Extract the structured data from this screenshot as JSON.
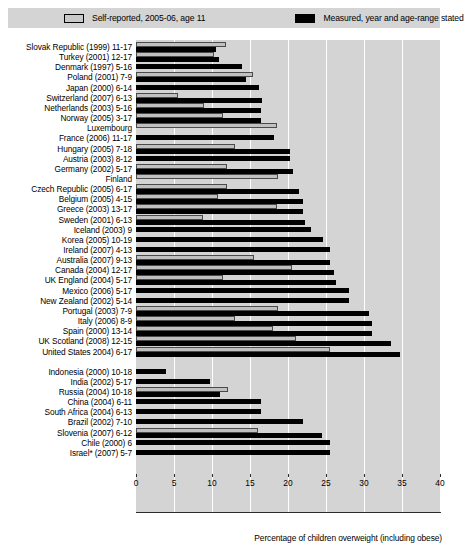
{
  "legend": {
    "items": [
      {
        "label": "Self-reported, 2005-06, age 11",
        "swatch": "light-swatch",
        "color": "#c9c9c9"
      },
      {
        "label": "Measured, year and age-range stated",
        "swatch": "dark-swatch",
        "color": "#000000"
      }
    ]
  },
  "axis": {
    "title": "Percentage of children overweight (including obese)",
    "ticks": [
      "0",
      "5",
      "10",
      "15",
      "20",
      "25",
      "30",
      "35",
      "40"
    ]
  },
  "chart_data": {
    "type": "bar",
    "orientation": "horizontal",
    "title": "",
    "subtitle": "",
    "xlabel": "Percentage of children overweight (including obese)",
    "ylabel": "",
    "xlim": [
      0,
      40
    ],
    "xticks": [
      0,
      5,
      10,
      15,
      20,
      25,
      30,
      35,
      40
    ],
    "grid": true,
    "legend_position": "top",
    "series": [
      {
        "name": "Self-reported, 2005-06, age 11",
        "color": "#c9c9c9"
      },
      {
        "name": "Measured, year and age-range stated",
        "color": "#000000"
      }
    ],
    "groups": [
      {
        "name": "OECD countries",
        "categories": [
          "Slovak Republic (1999) 11-17",
          "Turkey (2001) 12-17",
          "Denmark (1997) 5-16",
          "Poland (2001) 7-9",
          "Japan (2000) 6-14",
          "Switzerland (2007) 6-13",
          "Netherlands (2003) 5-16",
          "Norway (2005) 3-17",
          "Luxembourg",
          "France (2006) 11-17",
          "Hungary (2005) 7-18",
          "Austria (2003) 8-12",
          "Germany (2002) 5-17",
          "Finland",
          "Czech Republic (2005) 6-17",
          "Belgium (2005) 4-15",
          "Greece (2003) 13-17",
          "Sweden (2001) 6-13",
          "Iceland (2003) 9",
          "Korea (2005) 10-19",
          "Ireland (2007) 4-13",
          "Australia (2007) 9-13",
          "Canada (2004) 12-17",
          "UK England (2004) 5-17",
          "Mexico (2006) 5-17",
          "New Zealand (2002) 5-14",
          "Portugal (2003) 7-9",
          "Italy (2006) 8-9",
          "Spain (2000) 13-14",
          "UK Scotland (2008) 12-15",
          "United States 2004) 6-17"
        ],
        "measured": [
          10.5,
          10.9,
          13.9,
          14.5,
          16.2,
          16.6,
          16.5,
          16.5,
          null,
          18.1,
          20.2,
          20.2,
          20.6,
          null,
          21.5,
          22.0,
          22.0,
          22.3,
          23.0,
          24.6,
          25.5,
          25.5,
          26.0,
          26.3,
          28.0,
          28.0,
          30.6,
          31.0,
          31.0,
          33.5,
          34.7
        ],
        "self_reported": [
          11.9,
          10.3,
          null,
          15.4,
          null,
          5.5,
          9.0,
          11.5,
          18.5,
          null,
          13.0,
          null,
          12.0,
          18.7,
          12.0,
          10.8,
          18.5,
          8.8,
          null,
          null,
          null,
          15.5,
          20.5,
          11.5,
          null,
          null,
          18.7,
          13.0,
          18.0,
          21.0,
          25.5
        ]
      },
      {
        "name": "Non-OECD countries",
        "categories": [
          "Indonesia (2000) 10-18",
          "India (2002) 5-17",
          "Russia (2004) 10-18",
          "China (2004) 6-11",
          "South Africa (2004) 6-13",
          "Brazil (2002) 7-10",
          "Slovenia (2007) 6-12",
          "Chile (2000) 6",
          "Israel* (2007) 5-7"
        ],
        "measured": [
          4.0,
          9.8,
          11.0,
          16.5,
          16.5,
          22.0,
          24.5,
          25.5,
          25.5
        ],
        "self_reported": [
          null,
          null,
          12.1,
          null,
          null,
          null,
          16.0,
          null,
          null
        ]
      }
    ]
  }
}
